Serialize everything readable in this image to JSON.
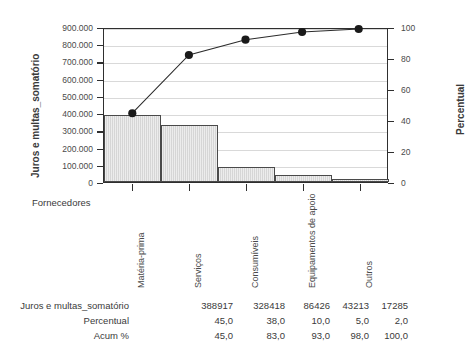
{
  "chart_data": {
    "type": "bar",
    "subtype": "pareto",
    "title": "",
    "xlabel": "Fornecedores",
    "ylabel": "Juros e multas_somatório",
    "y2label": "Percentual",
    "categories": [
      "Matéria-prima",
      "Serviços",
      "Consumíveis",
      "Equipamentos de apoio",
      "Outros"
    ],
    "values": [
      388917,
      328418,
      86426,
      43213,
      17285
    ],
    "percent": [
      45.0,
      38.0,
      10.0,
      5.0,
      2.0
    ],
    "cumulative": [
      45.0,
      83.0,
      93.0,
      98.0,
      100.0
    ],
    "ylim": [
      0,
      900000
    ],
    "y2lim": [
      0,
      100
    ],
    "yticks": [
      "0",
      "100.000",
      "200.000",
      "300.000",
      "400.000",
      "500.000",
      "600.000",
      "700.000",
      "800.000",
      "900.000"
    ],
    "ytick_values": [
      0,
      100000,
      200000,
      300000,
      400000,
      500000,
      600000,
      700000,
      800000,
      900000
    ],
    "y2ticks": [
      "0",
      "20",
      "40",
      "60",
      "80",
      "100"
    ],
    "y2tick_values": [
      0,
      20,
      40,
      60,
      80,
      100
    ],
    "grid": true,
    "legend": "none",
    "bar_color": "#d6d6d6",
    "bar_edge_color": "#4a4a4a",
    "line_color": "#2b2b2b",
    "marker_color": "#1a1a1a"
  },
  "table": {
    "rows": [
      {
        "label": "Juros e multas_somatório",
        "cells": [
          "388917",
          "328418",
          "86426",
          "43213",
          "17285"
        ]
      },
      {
        "label": "Percentual",
        "cells": [
          "45,0",
          "38,0",
          "10,0",
          "5,0",
          "2,0"
        ]
      },
      {
        "label": "Acum %",
        "cells": [
          "45,0",
          "83,0",
          "93,0",
          "98,0",
          "100,0"
        ]
      }
    ]
  }
}
